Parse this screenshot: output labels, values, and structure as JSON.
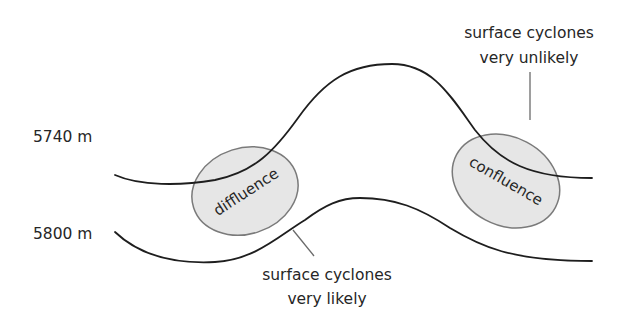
{
  "diagram": {
    "type": "upper-level height contour trough/ridge schematic",
    "contours": [
      {
        "id": "upper",
        "label": "5740 m"
      },
      {
        "id": "lower",
        "label": "5800 m"
      }
    ],
    "regions": [
      {
        "id": "left",
        "label": "diffluence"
      },
      {
        "id": "right",
        "label": "confluence"
      }
    ],
    "annotations": {
      "unlikely": {
        "line1": "surface cyclones",
        "line2": "very unlikely"
      },
      "likely": {
        "line1": "surface cyclones",
        "line2": "very likely"
      }
    },
    "colors": {
      "contour_line": "#1e1e1e",
      "region_fill": "#e6e6e6",
      "region_stroke": "#7a7a7a",
      "leader_line": "#6a6a6a",
      "text": "#262626",
      "background": "#ffffff"
    }
  }
}
